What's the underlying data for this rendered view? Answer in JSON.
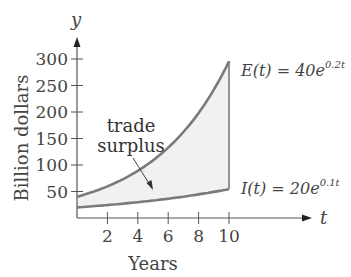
{
  "chart_data": {
    "type": "line",
    "title": "",
    "xlabel": "Years",
    "ylabel": "Billion dollars",
    "x_axis_symbol": "t",
    "y_axis_symbol": "y",
    "xlim": [
      0,
      10
    ],
    "ylim": [
      0,
      300
    ],
    "x_ticks": [
      2,
      4,
      6,
      8,
      10
    ],
    "y_ticks": [
      50,
      100,
      150,
      200,
      250,
      300
    ],
    "grid": false,
    "series": [
      {
        "name": "E(t) = 40e^{0.2t}",
        "formula": "40*exp(0.2*t)",
        "x": [
          0,
          1,
          2,
          3,
          4,
          5,
          6,
          7,
          8,
          9,
          10
        ],
        "values": [
          40,
          48.9,
          59.7,
          72.9,
          89.0,
          108.7,
          132.8,
          162.2,
          198.1,
          241.9,
          295.6
        ],
        "color": "#7a7a7a"
      },
      {
        "name": "I(t) = 20e^{0.1t}",
        "formula": "20*exp(0.1*t)",
        "x": [
          0,
          1,
          2,
          3,
          4,
          5,
          6,
          7,
          8,
          9,
          10
        ],
        "values": [
          20,
          22.1,
          24.4,
          27.0,
          29.8,
          33.0,
          36.4,
          40.3,
          44.5,
          49.2,
          54.4
        ],
        "color": "#7a7a7a"
      }
    ],
    "shaded_region": {
      "between": [
        "E(t)",
        "I(t)"
      ],
      "x_range": [
        0,
        10
      ],
      "color": "#efefef",
      "label": "trade surplus"
    },
    "annotations": [
      {
        "text_line1": "trade",
        "text_line2": "surplus",
        "points_to": "shaded region"
      },
      {
        "label": "E(t) = 40e",
        "exponent": "0.2t"
      },
      {
        "label": "I(t) = 20e",
        "exponent": "0.1t"
      }
    ]
  },
  "labels": {
    "y_symbol": "y",
    "t_symbol": "t",
    "ylabel": "Billion dollars",
    "xlabel": "Years",
    "y_ticks": [
      "300",
      "250",
      "200",
      "150",
      "100",
      "50"
    ],
    "x_ticks": [
      "2",
      "4",
      "6",
      "8",
      "10"
    ],
    "annot_line1": "trade",
    "annot_line2": "surplus",
    "e_label_main": "E(t) = 40e",
    "e_label_exp": "0.2t",
    "i_label_main": "I(t) = 20e",
    "i_label_exp": "0.1t"
  }
}
